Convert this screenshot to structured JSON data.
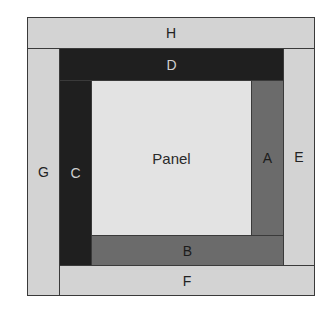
{
  "diagram": {
    "pieces": {
      "H": {
        "label": "H",
        "shade": "light",
        "color": "#d3d3d3"
      },
      "G": {
        "label": "G",
        "shade": "light",
        "color": "#d3d3d3"
      },
      "F": {
        "label": "F",
        "shade": "light",
        "color": "#d3d3d3"
      },
      "E": {
        "label": "E",
        "shade": "light",
        "color": "#d3d3d3"
      },
      "D": {
        "label": "D",
        "shade": "dark",
        "color": "#1f1f1f"
      },
      "C": {
        "label": "C",
        "shade": "dark",
        "color": "#1f1f1f"
      },
      "B": {
        "label": "B",
        "shade": "medium",
        "color": "#6b6b6b"
      },
      "A": {
        "label": "A",
        "shade": "medium",
        "color": "#6b6b6b"
      },
      "panel": {
        "label": "Panel",
        "color": "#e3e3e3"
      }
    }
  }
}
